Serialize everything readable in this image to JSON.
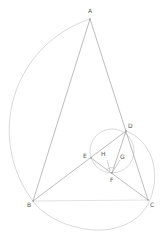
{
  "diagram": {
    "type": "geometry-construction",
    "colors": {
      "line": "#9a9a9a",
      "light_line": "#d0d0d0",
      "label": "#555555",
      "background": "#ffffff"
    },
    "points": [
      {
        "name": "A",
        "x": 90,
        "y": 19,
        "label_x": 88,
        "label_y": 12
      },
      {
        "name": "B",
        "x": 33,
        "y": 201,
        "label_x": 27,
        "label_y": 207
      },
      {
        "name": "C",
        "x": 148,
        "y": 200,
        "label_x": 150,
        "label_y": 207
      },
      {
        "name": "D",
        "x": 126,
        "y": 131,
        "label_x": 128,
        "label_y": 128
      },
      {
        "name": "E",
        "x": 91,
        "y": 158,
        "label_x": 83,
        "label_y": 157
      },
      {
        "name": "F",
        "x": 112,
        "y": 173,
        "label_x": 110,
        "label_y": 182
      },
      {
        "name": "G",
        "x": 118,
        "y": 158,
        "label_x": 120,
        "label_y": 158
      },
      {
        "name": "H",
        "x": 107,
        "y": 158,
        "label_x": 101,
        "label_y": 155
      }
    ],
    "segments": [
      "AB",
      "AC",
      "BC",
      "BD",
      "EC",
      "DF",
      "GF",
      "HF"
    ],
    "circles": [
      {
        "name": "arc-centered-D",
        "center": "D",
        "from": "A",
        "to": "B",
        "radius": 117
      },
      {
        "name": "small-circle",
        "cx": 112,
        "cy": 151,
        "r": 22
      },
      {
        "name": "arc-D-to-B",
        "from": "D",
        "to": "B",
        "through_right": 157,
        "bottom": 231
      }
    ]
  }
}
